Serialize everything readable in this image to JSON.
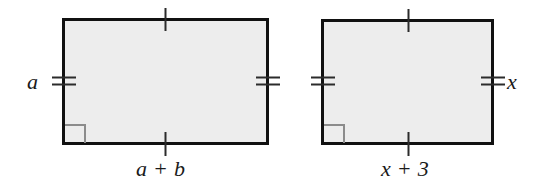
{
  "figure": {
    "type": "geometry-diagram",
    "background_color": "#ffffff",
    "stroke_color": "#111111",
    "fill_color": "#ededed",
    "right_angle_color": "#8c8c8c",
    "shapes": [
      {
        "id": "left-rectangle",
        "name": "rectangle-a",
        "x": 62,
        "y": 18,
        "width": 207,
        "height": 127,
        "fill": "#ededed",
        "stroke": "#111111",
        "stroke_width": 3,
        "right_angle_marker": "bottom-left",
        "tick_marks": {
          "top": 1,
          "bottom": 1,
          "left": 2,
          "right": 2
        },
        "labels": {
          "side_label": "a",
          "base_label": "a + b"
        }
      },
      {
        "id": "right-rectangle",
        "name": "rectangle-x",
        "x": 321,
        "y": 19,
        "width": 173,
        "height": 126,
        "fill": "#ededed",
        "stroke": "#111111",
        "stroke_width": 3,
        "right_angle_marker": "bottom-left",
        "tick_marks": {
          "top": 1,
          "bottom": 1,
          "left": 2,
          "right": 2
        },
        "labels": {
          "side_label": "x",
          "base_label": "x + 3"
        }
      }
    ]
  },
  "labels": {
    "left_rect_height": "a",
    "left_rect_base": "a + b",
    "right_rect_height": "x",
    "right_rect_base": "x + 3"
  }
}
